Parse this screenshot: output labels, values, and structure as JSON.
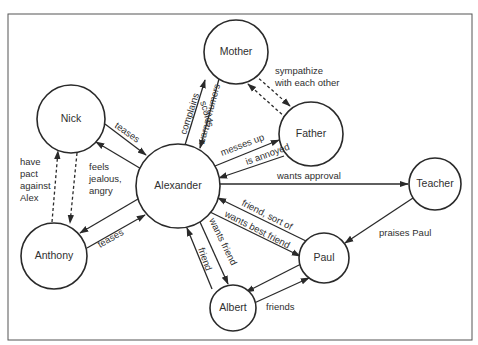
{
  "diagram": {
    "type": "relationship-map",
    "frame": {
      "x": 8,
      "y": 14,
      "w": 464,
      "h": 326
    },
    "nodes": [
      {
        "id": "mother",
        "label": "Mother",
        "cx": 236,
        "cy": 52,
        "r": 32
      },
      {
        "id": "father",
        "label": "Father",
        "cx": 311,
        "cy": 134,
        "r": 32
      },
      {
        "id": "nick",
        "label": "Nick",
        "cx": 71,
        "cy": 119,
        "r": 34
      },
      {
        "id": "alexander",
        "label": "Alexander",
        "cx": 178,
        "cy": 186,
        "r": 42
      },
      {
        "id": "anthony",
        "label": "Anthony",
        "cx": 54,
        "cy": 256,
        "r": 33
      },
      {
        "id": "teacher",
        "label": "Teacher",
        "cx": 435,
        "cy": 184,
        "r": 26
      },
      {
        "id": "paul",
        "label": "Paul",
        "cx": 324,
        "cy": 258,
        "r": 25
      },
      {
        "id": "albert",
        "label": "Albert",
        "cx": 233,
        "cy": 308,
        "r": 23
      }
    ],
    "edges": [
      {
        "from": "alexander",
        "to": "nick",
        "label": "",
        "style": "solid",
        "x1": 143,
        "y1": 170,
        "x2": 96,
        "y2": 142
      },
      {
        "from": "nick",
        "to": "alexander",
        "label": "teases",
        "style": "solid",
        "x1": 105,
        "y1": 124,
        "x2": 146,
        "y2": 155
      },
      {
        "from": "anthony",
        "to": "alexander",
        "label": "teases",
        "style": "solid",
        "x1": 87,
        "y1": 248,
        "x2": 145,
        "y2": 215
      },
      {
        "from": "alexander",
        "to": "anthony",
        "label": "",
        "style": "solid",
        "x1": 138,
        "y1": 199,
        "x2": 80,
        "y2": 233
      },
      {
        "from": "anthony",
        "to": "nick",
        "label": "",
        "style": "dashed",
        "x1": 52,
        "y1": 222,
        "x2": 58,
        "y2": 151
      },
      {
        "from": "nick",
        "to": "anthony",
        "label": "",
        "style": "dashed",
        "x1": 77,
        "y1": 153,
        "x2": 70,
        "y2": 223
      },
      {
        "from": "alexander",
        "to": "mother",
        "label": "complains",
        "style": "solid",
        "x1": 185,
        "y1": 145,
        "x2": 205,
        "y2": 80
      },
      {
        "from": "mother",
        "to": "alexander",
        "label": "scolds, warns, humors",
        "style": "solid",
        "x1": 219,
        "y1": 79,
        "x2": 200,
        "y2": 148
      },
      {
        "from": "alexander",
        "to": "father",
        "label": "messes up",
        "style": "solid",
        "x1": 215,
        "y1": 166,
        "x2": 279,
        "y2": 140
      },
      {
        "from": "father",
        "to": "alexander",
        "label": "is annoyed",
        "style": "solid",
        "x1": 284,
        "y1": 156,
        "x2": 219,
        "y2": 178
      },
      {
        "from": "mother",
        "to": "father",
        "label": "sympathize with each other",
        "style": "dashed",
        "x1": 255,
        "y1": 75,
        "x2": 290,
        "y2": 106
      },
      {
        "from": "father",
        "to": "mother",
        "label": "",
        "style": "dashed",
        "x1": 286,
        "y1": 118,
        "x2": 248,
        "y2": 84
      },
      {
        "from": "alexander",
        "to": "teacher",
        "label": "wants approval",
        "style": "solid",
        "x1": 220,
        "y1": 184,
        "x2": 408,
        "y2": 184
      },
      {
        "from": "teacher",
        "to": "paul",
        "label": "praises Paul",
        "style": "solid",
        "x1": 413,
        "y1": 198,
        "x2": 345,
        "y2": 243
      },
      {
        "from": "paul",
        "to": "alexander",
        "label": "friend, sort of",
        "style": "solid",
        "x1": 306,
        "y1": 241,
        "x2": 218,
        "y2": 198
      },
      {
        "from": "alexander",
        "to": "paul",
        "label": "wants best friend",
        "style": "solid",
        "x1": 210,
        "y1": 212,
        "x2": 300,
        "y2": 256
      },
      {
        "from": "alexander",
        "to": "albert",
        "label": "wants friend",
        "style": "solid",
        "x1": 200,
        "y1": 222,
        "x2": 228,
        "y2": 284
      },
      {
        "from": "albert",
        "to": "alexander",
        "label": "friend",
        "style": "solid",
        "x1": 212,
        "y1": 289,
        "x2": 187,
        "y2": 228
      },
      {
        "from": "paul",
        "to": "albert",
        "label": "",
        "style": "solid",
        "x1": 301,
        "y1": 264,
        "x2": 246,
        "y2": 292
      },
      {
        "from": "albert",
        "to": "paul",
        "label": "friends",
        "style": "solid",
        "x1": 252,
        "y1": 304,
        "x2": 309,
        "y2": 278
      }
    ],
    "labels": [
      {
        "id": "nick-teases",
        "text": "teases",
        "x": 114,
        "y": 127,
        "rotate": 35
      },
      {
        "id": "anthony-teases",
        "text": "teases",
        "x": 100,
        "y": 248,
        "rotate": -30
      },
      {
        "id": "have-pact",
        "lines": [
          "have",
          "pact",
          "against",
          "Alex"
        ],
        "x": 20,
        "y": 165
      },
      {
        "id": "feels-jealous",
        "lines": [
          "feels",
          "jealous,",
          "angry"
        ],
        "x": 89,
        "y": 170
      },
      {
        "id": "complains",
        "text": "complains",
        "x": 186,
        "y": 135,
        "rotate": -72
      },
      {
        "id": "scolds",
        "text": "scolds,",
        "x": 200,
        "y": 102,
        "rotate": 73
      },
      {
        "id": "warns-humors",
        "text": "warns, humors",
        "x": 204,
        "y": 145,
        "rotate": -75
      },
      {
        "id": "messes-up",
        "text": "messes up",
        "x": 222,
        "y": 156,
        "rotate": -21
      },
      {
        "id": "is-annoyed",
        "text": "is annoyed",
        "x": 247,
        "y": 165,
        "rotate": -20
      },
      {
        "id": "sympathize",
        "lines": [
          "sympathize",
          "with each other"
        ],
        "x": 275,
        "y": 74
      },
      {
        "id": "wants-approval",
        "text": "wants approval",
        "x": 277,
        "y": 179,
        "rotate": 0
      },
      {
        "id": "friend-sort-of",
        "text": "friend, sort of",
        "x": 241,
        "y": 205,
        "rotate": 27
      },
      {
        "id": "wants-best-friend",
        "text": "wants best friend",
        "x": 224,
        "y": 216,
        "rotate": 27
      },
      {
        "id": "wants-friend",
        "text": "wants friend",
        "x": 209,
        "y": 220,
        "rotate": 64
      },
      {
        "id": "friend",
        "text": "friend",
        "x": 198,
        "y": 249,
        "rotate": 70
      },
      {
        "id": "praises-paul",
        "text": "praises Paul",
        "x": 379,
        "y": 236,
        "rotate": 0
      },
      {
        "id": "friends",
        "text": "friends",
        "x": 266,
        "y": 310,
        "rotate": 0
      }
    ]
  }
}
